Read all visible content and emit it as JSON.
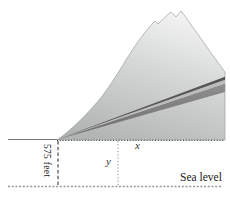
{
  "figure": {
    "labels": {
      "altitude": "575 feet",
      "x_distance": "x",
      "y_height": "y",
      "sea_level": "Sea level"
    },
    "colors": {
      "background": "#ffffff",
      "mountain_top": "#efefef",
      "mountain_base": "#b2b4b4",
      "road_top_edge": "#565656",
      "road_highlight": "#bcbcbc",
      "road_surface_light": "#929292",
      "road_surface_dark": "#6d6d6d",
      "ground_line": "#565656",
      "sea_line": "#989898",
      "text": "#222222"
    }
  }
}
